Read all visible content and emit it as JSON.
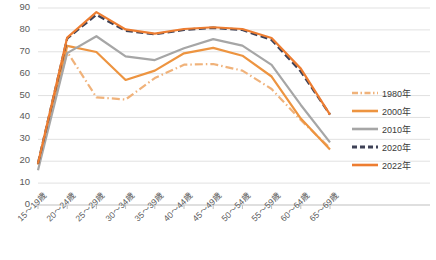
{
  "chart_data": {
    "type": "line",
    "title": "",
    "xlabel": "",
    "ylabel": "",
    "ylim": [
      0,
      90
    ],
    "ytick_step": 10,
    "grid": true,
    "legend_position": "right",
    "categories": [
      "15～19歳",
      "20～24歳",
      "25～29歳",
      "30～34歳",
      "35～39歳",
      "40～44歳",
      "45～49歳",
      "50～54歳",
      "55～59歳",
      "60～64歳",
      "65～69歳"
    ],
    "yticks": [
      "0",
      "10",
      "20",
      "30",
      "40",
      "50",
      "60",
      "70",
      "80",
      "90"
    ],
    "series": [
      {
        "name": "1980年",
        "color": "#f0b27a",
        "style": "dash-dot",
        "values": [
          18.5,
          70.0,
          49.2,
          48.2,
          58.0,
          64.1,
          64.4,
          61.4,
          53.0,
          38.8,
          26.0
        ]
      },
      {
        "name": "2000年",
        "color": "#ed9440",
        "style": "solid",
        "values": [
          18.5,
          72.7,
          69.9,
          57.1,
          61.4,
          69.3,
          71.8,
          68.2,
          58.7,
          39.5,
          25.4
        ]
      },
      {
        "name": "2010年",
        "color": "#a6a6a6",
        "style": "solid",
        "values": [
          15.9,
          69.4,
          77.1,
          67.9,
          66.2,
          71.6,
          75.8,
          72.8,
          64.0,
          45.7,
          28.6
        ]
      },
      {
        "name": "2020年",
        "color": "#3f4257",
        "style": "dashed",
        "values": [
          19.0,
          76.1,
          86.9,
          79.6,
          78.0,
          80.0,
          81.0,
          80.0,
          75.4,
          61.0,
          41.3
        ]
      },
      {
        "name": "2022年",
        "color": "#ed7d31",
        "style": "solid",
        "values": [
          19.0,
          76.5,
          88.1,
          80.2,
          78.3,
          80.4,
          81.2,
          80.4,
          76.3,
          62.3,
          41.3
        ]
      }
    ]
  },
  "legend": {
    "items": [
      {
        "label": "1980年"
      },
      {
        "label": "2000年"
      },
      {
        "label": "2010年"
      },
      {
        "label": "2020年"
      },
      {
        "label": "2022年"
      }
    ]
  }
}
